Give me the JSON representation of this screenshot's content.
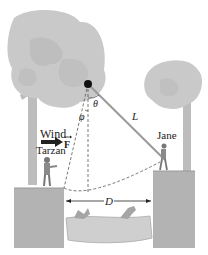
{
  "diagram": {
    "labels": {
      "wind": "Wind",
      "force": "F",
      "tarzan": "Tarzan",
      "jane": "Jane",
      "rope_length": "L",
      "theta": "θ",
      "phi": "φ",
      "distance": "D"
    },
    "icons": {
      "pivot": "pivot-point-icon",
      "force_arrow": "arrow-right-icon",
      "crocodile": "crocodile-icon"
    },
    "colors": {
      "tree": "#c9c9c9",
      "tree_dark": "#b0b0b0",
      "trunk": "#bdbdbd",
      "cliff": "#b3b3b3",
      "water": "#cfcfcf",
      "rope": "#9a9a9a",
      "text": "#222222"
    }
  }
}
